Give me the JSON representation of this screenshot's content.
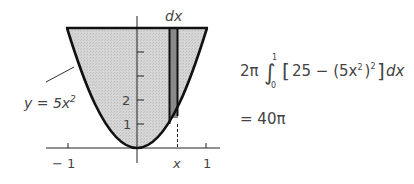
{
  "diagram": {
    "type": "solid-of-revolution-shell-method",
    "curve": {
      "label": "y = 5x²",
      "equation_parts": [
        "y = 5x",
        "2"
      ]
    },
    "x_axis": {
      "ticks": [
        {
          "value": -1,
          "label": "− 1"
        },
        {
          "value": 1,
          "label": "1"
        }
      ],
      "strip_label": "x"
    },
    "y_axis": {
      "ticks": [
        {
          "value": 1,
          "label": "1"
        },
        {
          "value": 2,
          "label": "2"
        },
        {
          "value": 3,
          "label": ""
        },
        {
          "value": 4,
          "label": ""
        }
      ]
    },
    "strip": {
      "label": "dx"
    },
    "colors": {
      "region_fill": "#d4d4d4",
      "strip_fill": "#8a8a8a",
      "stroke": "#111111",
      "text": "#444444"
    }
  },
  "formula": {
    "line1": {
      "coef": "2π",
      "integral": "∫",
      "upper": "1",
      "lower": "0",
      "lbracket": "[",
      "body1": "25 − (5x",
      "inner_exp": "2",
      "body2": ")",
      "outer_exp": "2",
      "rbracket": "]",
      "dx": "dx"
    },
    "line2": "= 40π"
  }
}
